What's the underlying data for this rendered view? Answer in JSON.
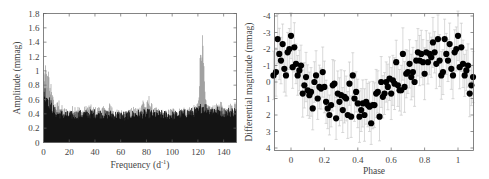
{
  "chart_data": [
    {
      "type": "line",
      "title": "",
      "xlabel": "Frequency (d⁻¹)",
      "ylabel": "Amplitude (mmag)",
      "xlim": [
        0,
        150
      ],
      "ylim": [
        0,
        1.8
      ],
      "xticks": [
        0,
        20,
        40,
        60,
        80,
        100,
        120,
        140
      ],
      "yticks": [
        0,
        0.2,
        0.4,
        0.6,
        0.8,
        1,
        1.2,
        1.4,
        1.6,
        1.8
      ],
      "ytick_labels": [
        "0",
        "0.2",
        "0.4",
        "0.6",
        "0.8",
        "1",
        "1.2",
        "1.4",
        "1.6",
        "1.8"
      ],
      "grid": false,
      "legend": null,
      "series": [
        {
          "name": "amplitude spectrum envelope",
          "x": [
            0,
            1,
            2,
            3,
            4,
            5,
            6,
            7,
            8,
            10,
            12,
            15,
            20,
            25,
            30,
            35,
            40,
            45,
            50,
            52,
            55,
            60,
            63,
            65,
            70,
            75,
            77,
            80,
            82,
            85,
            90,
            95,
            100,
            105,
            110,
            115,
            118,
            120,
            121,
            122,
            123,
            124,
            125,
            126,
            128,
            130,
            135,
            138,
            140,
            145,
            150
          ],
          "values": [
            1.1,
            1.05,
            1.1,
            0.95,
            1.05,
            0.8,
            0.95,
            0.7,
            0.6,
            0.55,
            0.62,
            0.5,
            0.48,
            0.55,
            0.48,
            0.55,
            0.5,
            0.52,
            0.48,
            0.6,
            0.45,
            0.48,
            0.4,
            0.45,
            0.5,
            0.52,
            0.65,
            0.55,
            0.67,
            0.5,
            0.48,
            0.45,
            0.5,
            0.48,
            0.52,
            0.48,
            0.55,
            0.6,
            0.9,
            1.42,
            1.62,
            1.42,
            0.95,
            0.6,
            0.55,
            0.5,
            0.55,
            0.6,
            0.52,
            0.55,
            0.6
          ]
        },
        {
          "name": "dense noise floor (black fill)",
          "x": [
            0,
            2,
            5,
            8,
            10,
            20,
            40,
            60,
            80,
            100,
            120,
            123,
            140,
            150
          ],
          "values": [
            0.8,
            0.75,
            0.6,
            0.5,
            0.45,
            0.42,
            0.45,
            0.42,
            0.45,
            0.42,
            0.48,
            0.55,
            0.47,
            0.48
          ]
        }
      ],
      "annotations": [
        {
          "text": "dominant peak",
          "x": 123,
          "y": 1.62
        }
      ]
    },
    {
      "type": "scatter",
      "title": "",
      "xlabel": "Phase",
      "ylabel": "Differential magnitude (mmag)",
      "xlim": [
        -0.11,
        1.1
      ],
      "ylim": [
        4,
        -4
      ],
      "y_inverted": true,
      "xticks": [
        0,
        0.2,
        0.4,
        0.6,
        0.8,
        1
      ],
      "xtick_labels": [
        "0",
        "0.2",
        "0.4",
        "0.6",
        "0.8",
        "1"
      ],
      "yticks": [
        -4,
        -3,
        -2,
        -1,
        0,
        1,
        2,
        3,
        4
      ],
      "ytick_labels": [
        "-4",
        "-3",
        "-2",
        "-1",
        "0",
        "1",
        "2",
        "3",
        "4"
      ],
      "grid": false,
      "legend": null,
      "error_bars": true,
      "error_bar_halfwidth": 1.2,
      "series": [
        {
          "name": "binned phase data",
          "x": [
            -0.105,
            -0.09,
            -0.08,
            -0.07,
            -0.06,
            -0.05,
            -0.04,
            -0.03,
            -0.02,
            -0.01,
            0.0,
            0.01,
            0.02,
            0.03,
            0.04,
            0.05,
            0.06,
            0.07,
            0.08,
            0.09,
            0.1,
            0.11,
            0.12,
            0.13,
            0.14,
            0.15,
            0.16,
            0.17,
            0.18,
            0.19,
            0.2,
            0.21,
            0.22,
            0.23,
            0.24,
            0.25,
            0.26,
            0.27,
            0.28,
            0.29,
            0.3,
            0.31,
            0.32,
            0.33,
            0.34,
            0.35,
            0.36,
            0.37,
            0.38,
            0.39,
            0.4,
            0.41,
            0.42,
            0.43,
            0.44,
            0.45,
            0.46,
            0.47,
            0.48,
            0.49,
            0.5,
            0.51,
            0.52,
            0.53,
            0.54,
            0.55,
            0.56,
            0.57,
            0.58,
            0.59,
            0.6,
            0.61,
            0.62,
            0.63,
            0.64,
            0.65,
            0.66,
            0.67,
            0.68,
            0.69,
            0.7,
            0.71,
            0.72,
            0.73,
            0.74,
            0.75,
            0.76,
            0.77,
            0.78,
            0.79,
            0.8,
            0.81,
            0.82,
            0.83,
            0.84,
            0.85,
            0.86,
            0.87,
            0.88,
            0.89,
            0.9,
            0.91,
            0.92,
            0.93,
            0.94,
            0.95,
            0.96,
            0.97,
            0.98,
            0.99,
            1.0,
            1.01,
            1.02,
            1.03,
            1.04,
            1.05,
            1.06,
            1.07,
            1.08,
            1.09
          ],
          "values": [
            -0.4,
            -0.6,
            -2.6,
            -1.7,
            -1.3,
            -2.3,
            -0.8,
            -0.4,
            -1.8,
            -2.0,
            -2.8,
            -0.9,
            -2.1,
            -1.1,
            -0.4,
            -0.7,
            -1.0,
            0.7,
            0.2,
            -0.3,
            0.5,
            0.8,
            0.6,
            1.6,
            0.0,
            -0.4,
            1.0,
            0.3,
            0.4,
            -0.6,
            0.3,
            1.2,
            1.6,
            2.0,
            1.4,
            0.2,
            0.1,
            2.2,
            0.7,
            1.2,
            0.8,
            1.7,
            0.9,
            1.0,
            2.0,
            0.1,
            2.1,
            -0.4,
            1.0,
            0.6,
            1.3,
            2.1,
            1.7,
            1.3,
            2.0,
            1.2,
            1.4,
            1.5,
            2.5,
            1.4,
            1.4,
            0.7,
            0.6,
            2.1,
            0.0,
            0.9,
            0.7,
            0.0,
            0.3,
            -0.2,
            0.7,
            -0.1,
            0.1,
            -1.2,
            0.2,
            0.5,
            0.5,
            -1.7,
            0.3,
            -0.5,
            -0.6,
            -1.1,
            -0.3,
            -0.6,
            0.0,
            -1.3,
            -1.8,
            -1.3,
            -1.7,
            -1.2,
            -0.5,
            -1.8,
            -1.2,
            -1.7,
            -1.5,
            -2.4,
            -1.8,
            -1.1,
            -2.6,
            -1.3,
            -0.4,
            -0.6,
            -2.6,
            -1.7,
            -1.3,
            -2.3,
            -0.8,
            -0.4,
            -1.8,
            -2.0,
            -2.8,
            -0.9,
            -2.1,
            -1.1,
            -0.4,
            -0.7,
            -1.0,
            0.7,
            0.2,
            -0.3
          ]
        }
      ]
    }
  ],
  "labels": {
    "left": {
      "xlabel_main": "Frequency (d",
      "xlabel_sup": "-1",
      "xlabel_close": ")",
      "ylabel": "Amplitude (mmag)",
      "xticks": [
        "0",
        "20",
        "40",
        "60",
        "80",
        "100",
        "120",
        "140"
      ],
      "yticks": [
        "0",
        "0.2",
        "0.4",
        "0.6",
        "0.8",
        "1",
        "1.2",
        "1.4",
        "1.6",
        "1.8"
      ]
    },
    "right": {
      "xlabel": "Phase",
      "ylabel": "Differential magnitude (mmag)",
      "xticks": [
        "0",
        "0.2",
        "0.4",
        "0.6",
        "0.8",
        "1"
      ],
      "yticks": [
        "-4",
        "-3",
        "-2",
        "-1",
        "0",
        "1",
        "2",
        "3",
        "4"
      ]
    }
  },
  "colors": {
    "axis": "#666666",
    "noise_fill": "#000000",
    "envelope": "#8a8a8a",
    "points": "#000000",
    "error_bars": "#c8c8c8",
    "text": "#444444"
  }
}
